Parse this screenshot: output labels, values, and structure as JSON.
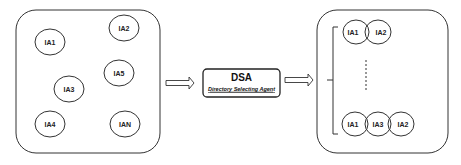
{
  "input_pool": {
    "agents": [
      {
        "label": "IA1",
        "cx": 50,
        "cy": 42
      },
      {
        "label": "IA2",
        "cx": 124,
        "cy": 28
      },
      {
        "label": "IA5",
        "cx": 119,
        "cy": 73
      },
      {
        "label": "IA3",
        "cx": 69,
        "cy": 89
      },
      {
        "label": "IA4",
        "cx": 50,
        "cy": 124
      },
      {
        "label": "IAN",
        "cx": 125,
        "cy": 124
      }
    ]
  },
  "dsa": {
    "title": "DSA",
    "subtitle": "Directory Selecting Agent"
  },
  "output_groups": {
    "top_group": [
      "IA1",
      "IA2"
    ],
    "bottom_group": [
      "IA1",
      "IA3",
      "IA2"
    ]
  },
  "colors": {
    "stroke": "#333333",
    "text": "#222222",
    "background": "#ffffff"
  }
}
